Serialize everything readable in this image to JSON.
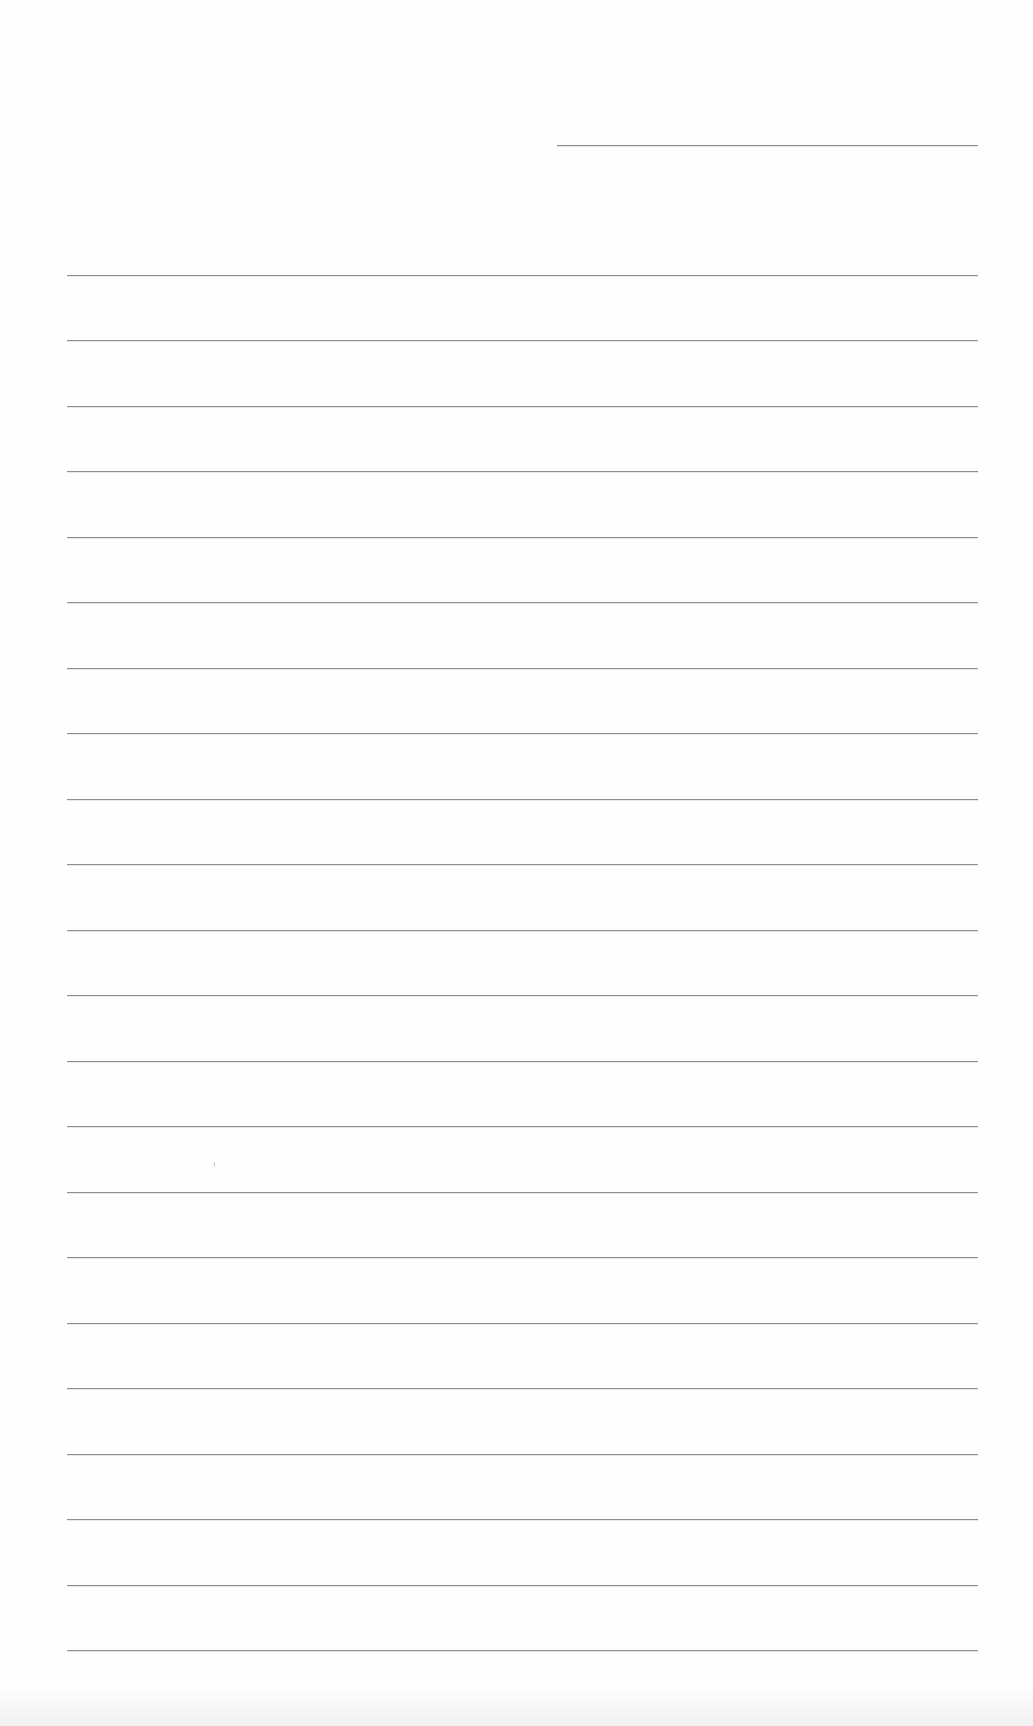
{
  "page": {
    "type": "lined-paper",
    "background_color": "#fefefe",
    "rule_color": "#8f8f8f",
    "header_rule": {
      "x_start": 557,
      "x_end": 978,
      "y": 145
    },
    "rules": {
      "count": 22,
      "x_start": 67,
      "x_end": 978,
      "y_first": 275,
      "y_last": 1650,
      "spacing": 65.5
    },
    "text_content": []
  }
}
